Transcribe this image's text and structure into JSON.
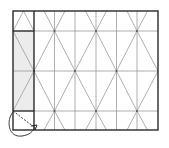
{
  "diagram": {
    "type": "origami-crease-pattern",
    "width": 169,
    "height": 148,
    "colors": {
      "background": "#ffffff",
      "outline": "#2a2a2a",
      "crease": "#9a9a9a",
      "strip_fill": "#ececec",
      "arrow": "#222222"
    },
    "square": {
      "x0": 13,
      "y0": 11,
      "x1": 158,
      "y1": 130
    },
    "strip": {
      "x0": 13,
      "x1": 34,
      "fill_y0": 31,
      "fill_y1": 111
    },
    "verticals": [
      34,
      54.5,
      75,
      96,
      116.5,
      137
    ],
    "horizontals": [
      31,
      71,
      111
    ],
    "vertices": [
      {
        "x": 54.5,
        "y": 31
      },
      {
        "x": 96,
        "y": 31
      },
      {
        "x": 137,
        "y": 31
      },
      {
        "x": 34,
        "y": 71
      },
      {
        "x": 75,
        "y": 71
      },
      {
        "x": 116.5,
        "y": 71
      },
      {
        "x": 54.5,
        "y": 111
      },
      {
        "x": 96,
        "y": 111
      },
      {
        "x": 137,
        "y": 111
      }
    ],
    "fold_arrow": {
      "description": "curved fold arrow from bottom-left corner to point on bottom edge",
      "dashed_line": {
        "x0": 13,
        "y0": 111,
        "x1": 34,
        "y1": 128
      }
    }
  }
}
